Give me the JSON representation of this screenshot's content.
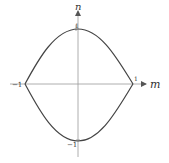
{
  "diagram": {
    "axes": {
      "x_label": "m",
      "y_label": "n"
    },
    "ticks": {
      "x_pos": "1",
      "x_neg": "−1",
      "y_pos": "1",
      "y_neg": "−1"
    },
    "colors": {
      "curve": "#444444",
      "axis": "#888888",
      "text": "#333333"
    }
  }
}
